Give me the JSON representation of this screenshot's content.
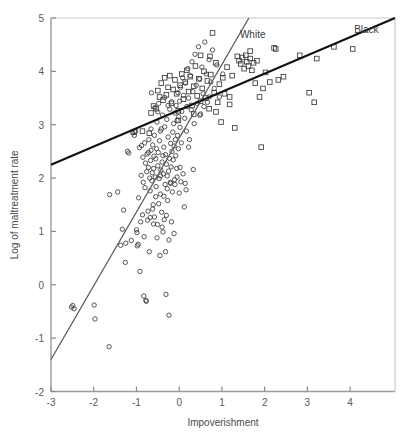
{
  "chart_data": {
    "type": "scatter",
    "title": "",
    "xlabel": "Impoverishment",
    "ylabel": "Log of maltreatment rate",
    "xlim": [
      -3,
      5.05
    ],
    "ylim": [
      -2,
      5
    ],
    "xticks": [
      -3,
      -2,
      -1,
      0,
      1,
      2,
      3,
      4
    ],
    "yticks": [
      -2,
      -1,
      0,
      1,
      2,
      3,
      4,
      5
    ],
    "xticklabels": [
      "-3",
      "-2",
      "-1",
      "0",
      "1",
      "2",
      "3",
      "4"
    ],
    "yticklabels": [
      "-2",
      "-1",
      "0",
      "1",
      "2",
      "3",
      "4",
      "5"
    ],
    "grid": false,
    "legend_position": "inline-annotation",
    "annotations": [
      {
        "text": "White",
        "x": 1.72,
        "y": 4.62,
        "color": "#333333"
      },
      {
        "text": "Black",
        "x": 4.38,
        "y": 4.72,
        "color": "#333333"
      }
    ],
    "series": [
      {
        "name": "White",
        "marker": "circle",
        "marker_size": 4.4,
        "color": "#3a3a3a",
        "fill": "none",
        "line": {
          "name": "white-regression-line",
          "color": "#5a5a5a",
          "width": 1.3,
          "x": [
            -3.0,
            1.63
          ],
          "y": [
            -1.4,
            5.0
          ],
          "slope": 1.382,
          "intercept": 2.746
        },
        "points": [
          [
            -2.52,
            -0.42
          ],
          [
            -2.46,
            -0.45
          ],
          [
            -2.49,
            -0.39
          ],
          [
            -1.99,
            -0.38
          ],
          [
            -1.97,
            -0.64
          ],
          [
            -1.64,
            -1.16
          ],
          [
            -1.63,
            1.69
          ],
          [
            -1.44,
            1.74
          ],
          [
            -1.37,
            0.74
          ],
          [
            -1.33,
            1.04
          ],
          [
            -1.3,
            1.4
          ],
          [
            -1.26,
            0.42
          ],
          [
            -1.25,
            0.78
          ],
          [
            -1.21,
            2.5
          ],
          [
            -1.18,
            2.47
          ],
          [
            -1.12,
            0.83
          ],
          [
            -1.09,
            2.85
          ],
          [
            -1.05,
            2.8
          ],
          [
            -1.02,
            2.88
          ],
          [
            -1.0,
            1.03
          ],
          [
            -0.99,
            0.98
          ],
          [
            -0.98,
            0.73
          ],
          [
            -0.96,
            0.76
          ],
          [
            -0.95,
            1.63
          ],
          [
            -0.93,
            2.57
          ],
          [
            -0.92,
            0.25
          ],
          [
            -0.9,
            1.18
          ],
          [
            -0.89,
            2.05
          ],
          [
            -0.88,
            2.61
          ],
          [
            -0.86,
            1.31
          ],
          [
            -0.85,
            2.39
          ],
          [
            -0.84,
            1.92
          ],
          [
            -0.83,
            -0.21
          ],
          [
            -0.82,
            0.9
          ],
          [
            -0.81,
            2.66
          ],
          [
            -0.8,
            1.82
          ],
          [
            -0.79,
            2.28
          ],
          [
            -0.78,
            -0.29
          ],
          [
            -0.77,
            -0.31
          ],
          [
            -0.76,
            2.12
          ],
          [
            -0.75,
            2.45
          ],
          [
            -0.74,
            1.21
          ],
          [
            -0.73,
            1.38
          ],
          [
            -0.72,
            2.2
          ],
          [
            -0.71,
            2.72
          ],
          [
            -0.7,
            0.62
          ],
          [
            -0.69,
            2.0
          ],
          [
            -0.68,
            1.76
          ],
          [
            -0.67,
            2.33
          ],
          [
            -0.66,
            2.52
          ],
          [
            -0.65,
            3.6
          ],
          [
            -0.64,
            1.95
          ],
          [
            -0.63,
            2.1
          ],
          [
            -0.62,
            2.62
          ],
          [
            -0.61,
            1.5
          ],
          [
            -0.6,
            2.18
          ],
          [
            -0.59,
            2.41
          ],
          [
            -0.58,
            1.27
          ],
          [
            -0.57,
            3.32
          ],
          [
            -0.56,
            2.02
          ],
          [
            -0.55,
            2.36
          ],
          [
            -0.54,
            1.84
          ],
          [
            -0.53,
            2.55
          ],
          [
            -0.52,
            3.05
          ],
          [
            -0.51,
            1.13
          ],
          [
            -0.5,
            2.23
          ],
          [
            -0.49,
            2.48
          ],
          [
            -0.48,
            3.4
          ],
          [
            -0.47,
            1.99
          ],
          [
            -0.46,
            2.7
          ],
          [
            -0.45,
            0.55
          ],
          [
            -0.44,
            1.7
          ],
          [
            -0.43,
            2.15
          ],
          [
            -0.42,
            2.92
          ],
          [
            -0.41,
            1.36
          ],
          [
            -0.4,
            2.3
          ],
          [
            -0.39,
            3.18
          ],
          [
            -0.38,
            0.99
          ],
          [
            -0.37,
            2.08
          ],
          [
            -0.36,
            2.58
          ],
          [
            -0.35,
            1.22
          ],
          [
            -0.34,
            3.51
          ],
          [
            -0.33,
            1.88
          ],
          [
            -0.32,
            2.44
          ],
          [
            -0.31,
            -0.18
          ],
          [
            -0.3,
            2.26
          ],
          [
            -0.29,
            3.1
          ],
          [
            -0.28,
            2.04
          ],
          [
            -0.27,
            1.58
          ],
          [
            -0.26,
            2.77
          ],
          [
            -0.25,
            2.13
          ],
          [
            -0.24,
            -0.57
          ],
          [
            -0.23,
            2.37
          ],
          [
            -0.22,
            3.29
          ],
          [
            -0.21,
            1.92
          ],
          [
            -0.2,
            2.65
          ],
          [
            -0.19,
            2.21
          ],
          [
            -0.18,
            3.43
          ],
          [
            -0.17,
            2.5
          ],
          [
            -0.16,
            1.74
          ],
          [
            -0.15,
            2.86
          ],
          [
            -0.14,
            2.34
          ],
          [
            -0.13,
            3.02
          ],
          [
            -0.12,
            2.6
          ],
          [
            -0.11,
            1.97
          ],
          [
            -0.1,
            3.22
          ],
          [
            -0.09,
            2.72
          ],
          [
            -0.08,
            2.42
          ],
          [
            -0.07,
            3.36
          ],
          [
            -0.06,
            2.18
          ],
          [
            -0.05,
            3.08
          ],
          [
            -0.04,
            2.8
          ],
          [
            -0.03,
            3.6
          ],
          [
            -0.02,
            2.55
          ],
          [
            -0.01,
            3.15
          ],
          [
            0.0,
            1.72
          ],
          [
            0.01,
            3.44
          ],
          [
            0.02,
            2.95
          ],
          [
            0.03,
            3.7
          ],
          [
            0.05,
            2.66
          ],
          [
            0.06,
            3.25
          ],
          [
            0.08,
            3.88
          ],
          [
            0.09,
            2.08
          ],
          [
            0.1,
            3.55
          ],
          [
            0.12,
            1.46
          ],
          [
            0.13,
            3.12
          ],
          [
            0.15,
            3.78
          ],
          [
            0.17,
            2.88
          ],
          [
            0.18,
            3.34
          ],
          [
            0.2,
            4.05
          ],
          [
            0.22,
            3.5
          ],
          [
            0.24,
            2.72
          ],
          [
            0.26,
            3.92
          ],
          [
            0.28,
            3.28
          ],
          [
            0.3,
            4.18
          ],
          [
            0.32,
            3.62
          ],
          [
            0.35,
            3.02
          ],
          [
            0.37,
            4.32
          ],
          [
            0.4,
            3.74
          ],
          [
            0.42,
            3.4
          ],
          [
            0.45,
            4.46
          ],
          [
            0.48,
            3.86
          ],
          [
            0.5,
            3.2
          ],
          [
            0.53,
            4.08
          ],
          [
            0.56,
            3.58
          ],
          [
            0.6,
            4.55
          ],
          [
            0.63,
            3.95
          ],
          [
            0.66,
            3.42
          ],
          [
            0.7,
            4.22
          ],
          [
            0.74,
            3.8
          ],
          [
            0.78,
            4.4
          ],
          [
            0.82,
            3.68
          ],
          [
            0.88,
            4.12
          ],
          [
            0.94,
            3.52
          ],
          [
            1.02,
            3.95
          ],
          [
            -0.44,
            2.88
          ],
          [
            -0.38,
            2.42
          ],
          [
            -0.55,
            1.65
          ],
          [
            -0.62,
            1.42
          ],
          [
            -0.48,
            1.52
          ],
          [
            -0.36,
            1.66
          ],
          [
            -0.28,
            1.8
          ],
          [
            -0.2,
            1.9
          ],
          [
            -0.58,
            2.8
          ],
          [
            -0.5,
            3.24
          ],
          [
            -0.34,
            2.96
          ],
          [
            -0.26,
            3.36
          ],
          [
            -0.66,
            2.92
          ],
          [
            -0.72,
            2.48
          ],
          [
            -0.44,
            2.04
          ],
          [
            -0.4,
            1.08
          ],
          [
            -0.52,
            0.88
          ],
          [
            -0.6,
            1.14
          ],
          [
            -0.68,
            1.26
          ],
          [
            -0.3,
            1.3
          ],
          [
            0.04,
            1.93
          ],
          [
            0.14,
            1.9
          ],
          [
            0.22,
            2.58
          ],
          [
            0.33,
            2.16
          ],
          [
            0.16,
            1.78
          ],
          [
            -0.1,
            1.88
          ],
          [
            -0.05,
            2.02
          ],
          [
            0.02,
            2.2
          ],
          [
            -0.18,
            1.18
          ],
          [
            -0.12,
            0.96
          ],
          [
            -0.24,
            0.84
          ],
          [
            -0.32,
            0.62
          ],
          [
            0.58,
            3.34
          ],
          [
            0.48,
            3.18
          ],
          [
            0.7,
            3.52
          ]
        ]
      },
      {
        "name": "Black",
        "marker": "square",
        "marker_size": 4.6,
        "color": "#3a3a3a",
        "fill": "none",
        "line": {
          "name": "black-regression-line",
          "color": "#111111",
          "width": 2.0,
          "x": [
            -3.0,
            5.05
          ],
          "y": [
            2.25,
            5.0
          ],
          "slope": 0.3416,
          "intercept": 3.275
        },
        "points": [
          [
            -1.05,
            2.86
          ],
          [
            -0.66,
            3.22
          ],
          [
            -0.6,
            3.35
          ],
          [
            -0.54,
            3.3
          ],
          [
            -0.5,
            3.64
          ],
          [
            -0.46,
            3.52
          ],
          [
            -0.42,
            3.78
          ],
          [
            -0.38,
            3.46
          ],
          [
            -0.34,
            3.88
          ],
          [
            -0.3,
            3.56
          ],
          [
            -0.26,
            3.7
          ],
          [
            -0.22,
            3.92
          ],
          [
            -0.18,
            3.4
          ],
          [
            -0.14,
            3.66
          ],
          [
            -0.1,
            3.84
          ],
          [
            -0.06,
            3.58
          ],
          [
            -0.02,
            3.26
          ],
          [
            0.02,
            3.74
          ],
          [
            0.06,
            3.95
          ],
          [
            0.1,
            3.48
          ],
          [
            0.14,
            3.8
          ],
          [
            0.18,
            4.02
          ],
          [
            0.22,
            3.62
          ],
          [
            0.26,
            3.9
          ],
          [
            0.3,
            3.36
          ],
          [
            0.34,
            3.72
          ],
          [
            0.38,
            4.1
          ],
          [
            0.42,
            3.54
          ],
          [
            0.46,
            3.86
          ],
          [
            0.5,
            3.44
          ],
          [
            0.54,
            3.68
          ],
          [
            0.58,
            4.0
          ],
          [
            0.62,
            3.5
          ],
          [
            0.66,
            3.82
          ],
          [
            0.7,
            3.3
          ],
          [
            0.74,
            3.94
          ],
          [
            0.78,
            4.72
          ],
          [
            0.82,
            3.6
          ],
          [
            0.86,
            4.16
          ],
          [
            0.9,
            3.42
          ],
          [
            0.94,
            3.76
          ],
          [
            0.98,
            3.05
          ],
          [
            1.02,
            3.88
          ],
          [
            1.06,
            3.58
          ],
          [
            1.12,
            4.08
          ],
          [
            1.18,
            3.52
          ],
          [
            1.24,
            3.92
          ],
          [
            1.3,
            2.94
          ],
          [
            1.36,
            4.28
          ],
          [
            1.4,
            4.2
          ],
          [
            1.44,
            4.14
          ],
          [
            1.48,
            4.26
          ],
          [
            1.52,
            4.05
          ],
          [
            1.56,
            4.3
          ],
          [
            1.58,
            4.18
          ],
          [
            1.62,
            4.1
          ],
          [
            1.66,
            4.24
          ],
          [
            1.7,
            4.02
          ],
          [
            1.74,
            4.16
          ],
          [
            1.78,
            3.78
          ],
          [
            1.82,
            4.2
          ],
          [
            1.88,
            3.52
          ],
          [
            1.92,
            2.58
          ],
          [
            1.96,
            3.68
          ],
          [
            2.02,
            3.98
          ],
          [
            2.12,
            3.8
          ],
          [
            2.22,
            4.44
          ],
          [
            2.26,
            4.42
          ],
          [
            2.32,
            3.84
          ],
          [
            2.44,
            3.9
          ],
          [
            2.82,
            4.3
          ],
          [
            3.04,
            3.6
          ],
          [
            3.16,
            3.42
          ],
          [
            3.22,
            4.24
          ],
          [
            3.62,
            4.46
          ],
          [
            4.06,
            4.42
          ],
          [
            1.66,
            4.38
          ],
          [
            0.72,
            4.28
          ],
          [
            1.18,
            3.38
          ],
          [
            0.86,
            3.24
          ],
          [
            0.34,
            3.2
          ],
          [
            -0.02,
            3.08
          ],
          [
            0.5,
            4.3
          ],
          [
            -0.7,
            2.84
          ],
          [
            -0.86,
            2.88
          ]
        ]
      }
    ]
  },
  "figure": {
    "background_color": "#ffffff",
    "frame_color": "#9a9a9a",
    "tick_color": "#8a8a8a"
  }
}
